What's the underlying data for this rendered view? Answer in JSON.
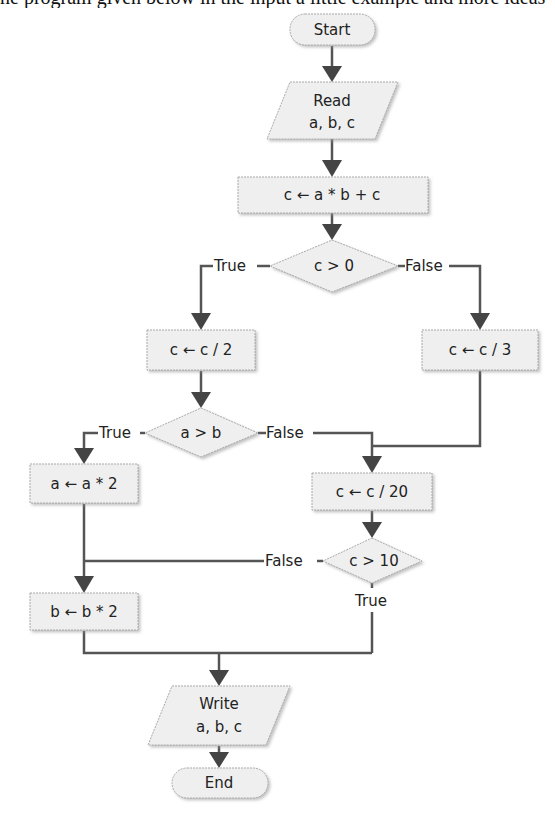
{
  "page": {
    "clipped_heading_text": "ne program given below in the input a little example and more ideas"
  },
  "flowchart": {
    "nodes": {
      "start": {
        "type": "terminal",
        "label": "Start"
      },
      "read": {
        "type": "io",
        "line1": "Read",
        "line2": "a, b, c"
      },
      "assign1": {
        "type": "process",
        "label": "c ← a * b + c"
      },
      "decision1": {
        "type": "decision",
        "label": "c > 0",
        "true_label": "True",
        "false_label": "False"
      },
      "div2": {
        "type": "process",
        "label": "c ← c / 2"
      },
      "div3": {
        "type": "process",
        "label": "c ← c / 3"
      },
      "decision2": {
        "type": "decision",
        "label": "a > b",
        "true_label": "True",
        "false_label": "False"
      },
      "a_double": {
        "type": "process",
        "label": "a ← a * 2"
      },
      "div20": {
        "type": "process",
        "label": "c ← c / 20"
      },
      "decision3": {
        "type": "decision",
        "label": "c > 10",
        "true_label": "True",
        "false_label": "False"
      },
      "b_double": {
        "type": "process",
        "label": "b ← b * 2"
      },
      "write": {
        "type": "io",
        "line1": "Write",
        "line2": "a, b, c"
      },
      "end": {
        "type": "terminal",
        "label": "End"
      }
    },
    "colors": {
      "shape_fill": "#efefef",
      "shape_border": "#aaaaaa",
      "connector": "#555555",
      "text": "#222222"
    }
  }
}
